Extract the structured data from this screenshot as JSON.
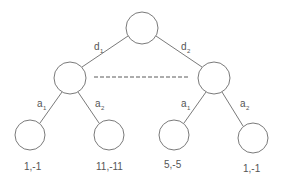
{
  "diagram": {
    "type": "extensive-form game tree",
    "colors": {
      "stroke": "#7a7a7a",
      "text": "#555555",
      "info_set": "#5a5a5a",
      "background": "#ffffff"
    },
    "nodes": {
      "root": {
        "cx": 142,
        "cy": 28,
        "r": 16
      },
      "left": {
        "cx": 70,
        "cy": 78,
        "r": 16
      },
      "right": {
        "cx": 214,
        "cy": 78,
        "r": 16
      },
      "leaves": [
        {
          "cx": 30,
          "cy": 135,
          "r": 15,
          "payoff": "1,-1"
        },
        {
          "cx": 109,
          "cy": 135,
          "r": 15,
          "payoff": "11,-11"
        },
        {
          "cx": 174,
          "cy": 135,
          "r": 15,
          "payoff": "5,-5"
        },
        {
          "cx": 253,
          "cy": 138,
          "r": 15,
          "payoff": "1,-1"
        }
      ]
    },
    "edges": {
      "root_left": {
        "label": "d",
        "sub": "1"
      },
      "root_right": {
        "label": "d",
        "sub": "2"
      },
      "left_leaf1": {
        "label": "a",
        "sub": "1"
      },
      "left_leaf2": {
        "label": "a",
        "sub": "2"
      },
      "right_leaf3": {
        "label": "a",
        "sub": "1"
      },
      "right_leaf4": {
        "label": "a",
        "sub": "2"
      }
    },
    "information_set": {
      "style": "dashed",
      "connects": [
        "left",
        "right"
      ]
    }
  }
}
